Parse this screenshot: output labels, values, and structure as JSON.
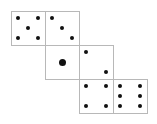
{
  "diagram": {
    "type": "die-net",
    "face_size": 34,
    "border_color": "#b8b8b8",
    "pip_color": "#111111",
    "faces": [
      {
        "id": "face-five",
        "value": 5,
        "x": 11,
        "y": 11,
        "pips": [
          [
            6,
            6
          ],
          [
            26,
            6
          ],
          [
            16,
            16
          ],
          [
            6,
            26
          ],
          [
            26,
            26
          ]
        ]
      },
      {
        "id": "face-three",
        "value": 3,
        "x": 45,
        "y": 11,
        "pips": [
          [
            6,
            6
          ],
          [
            16,
            16
          ],
          [
            26,
            26
          ]
        ]
      },
      {
        "id": "face-one",
        "value": 1,
        "x": 45,
        "y": 45,
        "pips": [
          [
            16,
            16
          ]
        ],
        "big": true
      },
      {
        "id": "face-two",
        "value": 2,
        "x": 79,
        "y": 45,
        "pips": [
          [
            6,
            6
          ],
          [
            26,
            26
          ]
        ]
      },
      {
        "id": "face-four",
        "value": 4,
        "x": 79,
        "y": 79,
        "pips": [
          [
            6,
            6
          ],
          [
            26,
            6
          ],
          [
            6,
            26
          ],
          [
            26,
            26
          ]
        ]
      },
      {
        "id": "face-six",
        "value": 6,
        "x": 113,
        "y": 79,
        "pips": [
          [
            6,
            6
          ],
          [
            26,
            6
          ],
          [
            6,
            16
          ],
          [
            26,
            16
          ],
          [
            6,
            26
          ],
          [
            26,
            26
          ]
        ]
      }
    ]
  }
}
